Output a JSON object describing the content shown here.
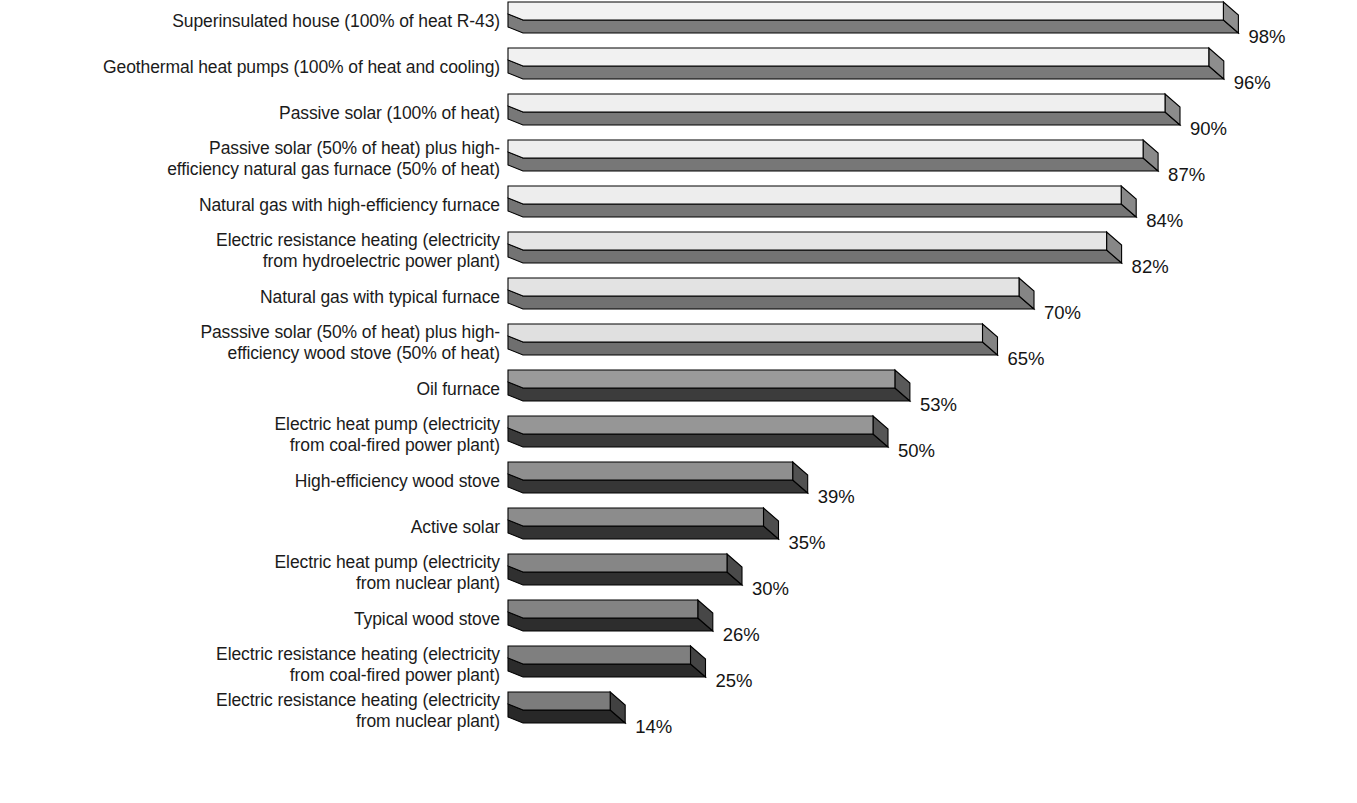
{
  "figure": {
    "units": "percent",
    "background_color": "#ffffff",
    "text_color": "#1b1b1b"
  },
  "chart_data": {
    "type": "bar",
    "orientation": "horizontal",
    "xlabel": "",
    "ylabel": "",
    "xlim": [
      0,
      100
    ],
    "grid": false,
    "legend": "none",
    "value_suffix": "%",
    "categories": [
      "Superinsulated house (100% of heat R-43)",
      "Geothermal heat pumps (100% of heat and cooling)",
      "Passive solar (100% of heat)",
      "Passive solar (50% of heat) plus high-\nefficiency natural gas furnace (50% of heat)",
      "Natural gas with high-efficiency furnace",
      "Electric resistance heating (electricity\nfrom hydroelectric power plant)",
      "Natural gas with typical furnace",
      "Passsive solar (50% of heat) plus high-\nefficiency wood stove (50% of heat)",
      "Oil furnace",
      "Electric heat pump (electricity\nfrom coal-fired power plant)",
      "High-efficiency wood stove",
      "Active solar",
      "Electric heat pump (electricity\nfrom nuclear plant)",
      "Typical wood stove",
      "Electric resistance heating (electricity\nfrom coal-fired power plant)",
      "Electric resistance heating (electricity\nfrom nuclear plant)"
    ],
    "values": [
      98,
      96,
      90,
      87,
      84,
      82,
      70,
      65,
      53,
      50,
      39,
      35,
      30,
      26,
      25,
      14
    ],
    "value_labels": [
      "98%",
      "96%",
      "90%",
      "87%",
      "84%",
      "82%",
      "70%",
      "65%",
      "53%",
      "50%",
      "39%",
      "35%",
      "30%",
      "26%",
      "25%",
      "14%"
    ],
    "bar_colors_top": [
      "#f2f2f2",
      "#f1f1f1",
      "#efefef",
      "#eeeeee",
      "#ededed",
      "#e5e5e5",
      "#e3e3e3",
      "#e0e0e0",
      "#9a9a9a",
      "#969696",
      "#8f8f8f",
      "#8c8c8c",
      "#868686",
      "#838383",
      "#7f7f7f",
      "#7c7c7c"
    ],
    "bar_colors_side": [
      "#8f8f8f",
      "#8d8d8d",
      "#8b8b8b",
      "#8a8a8a",
      "#898989",
      "#878787",
      "#858585",
      "#838383",
      "#595959",
      "#565656",
      "#515151",
      "#4e4e4e",
      "#4a4a4a",
      "#474747",
      "#444444",
      "#414141"
    ],
    "bar_colors_front": [
      "#7c7c7c",
      "#7a7a7a",
      "#787878",
      "#777777",
      "#757575",
      "#737373",
      "#717171",
      "#6f6f6f",
      "#3c3c3c",
      "#3a3a3a",
      "#363636",
      "#333333",
      "#303030",
      "#2d2d2d",
      "#2b2b2b",
      "#282828"
    ]
  },
  "rows": [
    {
      "label": "Superinsulated house (100% of heat R-43)",
      "value": 98,
      "value_label": "98%",
      "lines": 1
    },
    {
      "label": "Geothermal heat pumps (100% of heat and cooling)",
      "value": 96,
      "value_label": "96%",
      "lines": 1
    },
    {
      "label": "Passive solar (100% of heat)",
      "value": 90,
      "value_label": "90%",
      "lines": 1
    },
    {
      "label": "Passive solar (50% of heat) plus high-\nefficiency natural gas furnace (50% of heat)",
      "value": 87,
      "value_label": "87%",
      "lines": 2
    },
    {
      "label": "Natural gas with high-efficiency furnace",
      "value": 84,
      "value_label": "84%",
      "lines": 1
    },
    {
      "label": "Electric resistance heating (electricity\nfrom hydroelectric power plant)",
      "value": 82,
      "value_label": "82%",
      "lines": 2
    },
    {
      "label": "Natural gas with typical furnace",
      "value": 70,
      "value_label": "70%",
      "lines": 1
    },
    {
      "label": "Passsive solar (50% of heat) plus high-\nefficiency wood stove (50% of heat)",
      "value": 65,
      "value_label": "65%",
      "lines": 2
    },
    {
      "label": "Oil furnace",
      "value": 53,
      "value_label": "53%",
      "lines": 1
    },
    {
      "label": "Electric heat pump (electricity\nfrom coal-fired power plant)",
      "value": 50,
      "value_label": "50%",
      "lines": 2
    },
    {
      "label": "High-efficiency wood stove",
      "value": 39,
      "value_label": "39%",
      "lines": 1
    },
    {
      "label": "Active solar",
      "value": 35,
      "value_label": "35%",
      "lines": 1
    },
    {
      "label": "Electric heat pump (electricity\nfrom nuclear plant)",
      "value": 30,
      "value_label": "30%",
      "lines": 2
    },
    {
      "label": "Typical wood stove",
      "value": 26,
      "value_label": "26%",
      "lines": 1
    },
    {
      "label": "Electric resistance heating (electricity\nfrom coal-fired power plant)",
      "value": 25,
      "value_label": "25%",
      "lines": 2
    },
    {
      "label": "Electric resistance heating (electricity\nfrom nuclear plant)",
      "value": 14,
      "value_label": "14%",
      "lines": 2
    }
  ]
}
